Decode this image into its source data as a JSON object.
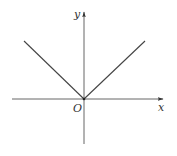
{
  "diagram": {
    "type": "function-graph",
    "function": "y = |x|",
    "labels": {
      "y_axis": "y",
      "x_axis": "x",
      "origin": "O"
    },
    "colors": {
      "axis": "#555555",
      "curve": "#444444",
      "background": "#ffffff"
    }
  }
}
